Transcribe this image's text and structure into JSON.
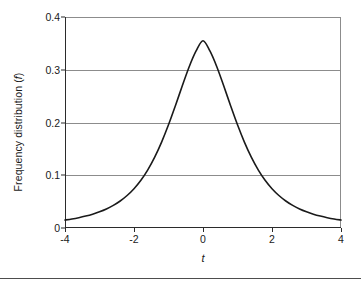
{
  "chart_data": {
    "type": "line",
    "title": "",
    "subtitle": "",
    "xlabel": "t",
    "ylabel": "Frequency distribution (f)",
    "ylabel_prefix": "Frequency distribution (",
    "ylabel_italic": "f",
    "ylabel_suffix": ")",
    "xlim": [
      -4,
      4
    ],
    "ylim": [
      0,
      0.4
    ],
    "grid": "horizontal",
    "legend": "none",
    "annotations": [],
    "series_name": "Student's t distribution density",
    "curve_color": "#1a1a1a",
    "grid_color": "#8c8c8c",
    "axis_color": "#2b2b2b",
    "background_color": "#ffffff",
    "peak_value": 0.355,
    "peak_x": 0,
    "x_ticks": [
      {
        "value": -4,
        "label": "-4"
      },
      {
        "value": -2,
        "label": "-2"
      },
      {
        "value": 0,
        "label": "0"
      },
      {
        "value": 2,
        "label": "2"
      },
      {
        "value": 4,
        "label": "4"
      }
    ],
    "y_ticks": [
      {
        "value": 0,
        "label": "0"
      },
      {
        "value": 0.1,
        "label": "0.1"
      },
      {
        "value": 0.2,
        "label": "0.2"
      },
      {
        "value": 0.3,
        "label": "0.3"
      },
      {
        "value": 0.4,
        "label": "0.4"
      }
    ],
    "gridline_values": [
      0.1,
      0.2,
      0.3
    ],
    "x": [
      -4.0,
      -3.8,
      -3.6,
      -3.4,
      -3.2,
      -3.0,
      -2.8,
      -2.6,
      -2.4,
      -2.2,
      -2.0,
      -1.8,
      -1.6,
      -1.4,
      -1.2,
      -1.0,
      -0.8,
      -0.6,
      -0.4,
      -0.2,
      0.0,
      0.2,
      0.4,
      0.6,
      0.8,
      1.0,
      1.2,
      1.4,
      1.6,
      1.8,
      2.0,
      2.2,
      2.4,
      2.6,
      2.8,
      3.0,
      3.2,
      3.4,
      3.6,
      3.8,
      4.0
    ],
    "values": [
      0.0151,
      0.0171,
      0.0196,
      0.0226,
      0.0262,
      0.0307,
      0.0361,
      0.0428,
      0.0512,
      0.0616,
      0.0745,
      0.0905,
      0.1103,
      0.1343,
      0.1628,
      0.1956,
      0.2318,
      0.2696,
      0.3058,
      0.3357,
      0.355,
      0.3357,
      0.3058,
      0.2696,
      0.2318,
      0.1956,
      0.1628,
      0.1343,
      0.1103,
      0.0905,
      0.0745,
      0.0616,
      0.0512,
      0.0428,
      0.0361,
      0.0307,
      0.0262,
      0.0226,
      0.0196,
      0.0171,
      0.0151
    ]
  }
}
